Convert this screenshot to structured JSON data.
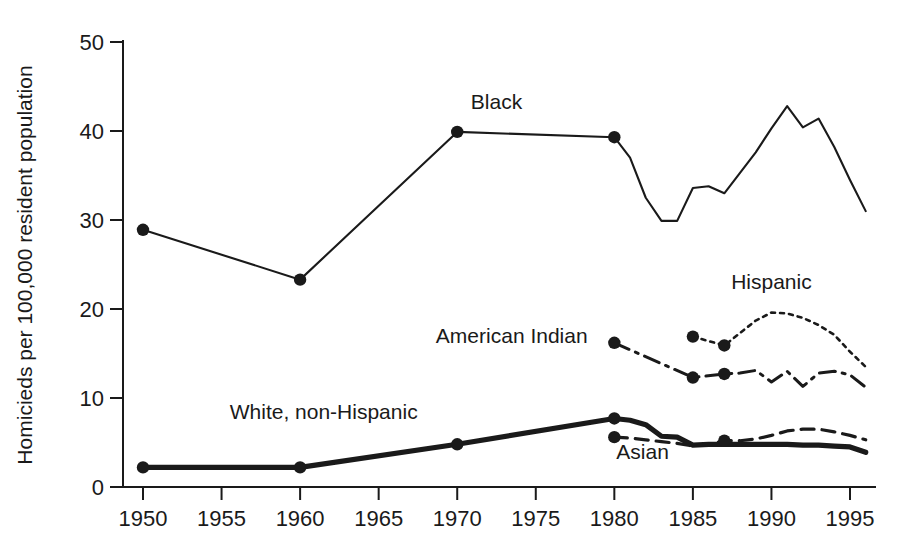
{
  "chart_data": {
    "type": "line",
    "title": "",
    "xlabel": "",
    "ylabel": "Homicieds per 100,000 resident population",
    "xlim": [
      1950,
      1996
    ],
    "ylim": [
      0,
      50
    ],
    "grid": false,
    "legend_position": "inline-labels",
    "xticks": [
      "1950",
      "1955",
      "1960",
      "1965",
      "1970",
      "1975",
      "1980",
      "1985",
      "1990",
      "1995"
    ],
    "xtick_values": [
      1950,
      1955,
      1960,
      1965,
      1970,
      1975,
      1980,
      1985,
      1990,
      1995
    ],
    "yticks": [
      "0",
      "10",
      "20",
      "30",
      "40",
      "50"
    ],
    "ytick_values": [
      0,
      10,
      20,
      30,
      40,
      50
    ],
    "series": [
      {
        "name": "Black",
        "label": "Black",
        "line_style": "solid-thin",
        "label_x": 1972.5,
        "label_y": 42.5,
        "x": [
          1950,
          1960,
          1970,
          1980,
          1981,
          1982,
          1983,
          1984,
          1985,
          1986,
          1987,
          1988,
          1989,
          1990,
          1991,
          1992,
          1993,
          1994,
          1995,
          1996
        ],
        "values": [
          28.9,
          23.3,
          39.9,
          39.3,
          37.0,
          32.5,
          29.9,
          29.9,
          33.6,
          33.8,
          33.0,
          35.3,
          37.6,
          40.3,
          42.8,
          40.4,
          41.4,
          38.2,
          34.5,
          31.0
        ],
        "markers_x": [
          1950,
          1960,
          1970,
          1980
        ],
        "markers_y": [
          28.9,
          23.3,
          39.9,
          39.3
        ]
      },
      {
        "name": "Hispanic",
        "label": "Hispanic",
        "line_style": "dotted",
        "label_x": 1990.0,
        "label_y": 22.3,
        "x": [
          1985,
          1987,
          1988,
          1989,
          1990,
          1991,
          1992,
          1993,
          1994,
          1995,
          1996
        ],
        "values": [
          16.9,
          15.9,
          17.3,
          18.7,
          19.6,
          19.5,
          19.0,
          18.2,
          17.1,
          15.2,
          13.5
        ],
        "markers_x": [
          1985,
          1987
        ],
        "markers_y": [
          16.9,
          15.9
        ]
      },
      {
        "name": "American Indian",
        "label": "American Indian",
        "line_style": "dash-dot",
        "label_x": 1978.3,
        "label_y": 16.2,
        "x": [
          1980,
          1985,
          1987,
          1988,
          1989,
          1990,
          1991,
          1992,
          1993,
          1994,
          1995,
          1996
        ],
        "values": [
          16.2,
          12.3,
          12.7,
          12.8,
          13.1,
          11.8,
          13.0,
          11.3,
          12.8,
          13.0,
          12.6,
          11.2
        ],
        "markers_x": [
          1980,
          1985,
          1987
        ],
        "markers_y": [
          16.2,
          12.3,
          12.7
        ]
      },
      {
        "name": "White, non-Hispanic",
        "label": "White, non-Hispanic",
        "line_style": "solid-thick",
        "label_x": 1961.5,
        "label_y": 7.6,
        "x": [
          1950,
          1960,
          1970,
          1980,
          1981,
          1982,
          1983,
          1984,
          1985,
          1986,
          1987,
          1988,
          1989,
          1990,
          1991,
          1992,
          1993,
          1994,
          1995,
          1996
        ],
        "values": [
          2.2,
          2.2,
          4.8,
          7.7,
          7.5,
          7.0,
          5.7,
          5.6,
          4.7,
          4.8,
          4.8,
          4.8,
          4.8,
          4.8,
          4.8,
          4.7,
          4.7,
          4.6,
          4.5,
          3.9
        ],
        "markers_x": [
          1950,
          1960,
          1970,
          1980
        ],
        "markers_y": [
          2.2,
          2.2,
          4.8,
          7.7
        ]
      },
      {
        "name": "Asian",
        "label": "Asian",
        "line_style": "dashed",
        "label_x": 1981.8,
        "label_y": 3.1,
        "x": [
          1980,
          1981,
          1982,
          1983,
          1984,
          1985,
          1986,
          1987,
          1988,
          1989,
          1990,
          1991,
          1992,
          1993,
          1994,
          1995,
          1996
        ],
        "values": [
          5.6,
          5.5,
          5.3,
          5.1,
          4.9,
          4.6,
          4.8,
          5.2,
          5.2,
          5.4,
          5.8,
          6.3,
          6.5,
          6.5,
          6.2,
          5.8,
          5.3
        ],
        "markers_x": [
          1980,
          1987
        ],
        "markers_y": [
          5.6,
          5.2
        ]
      }
    ]
  }
}
